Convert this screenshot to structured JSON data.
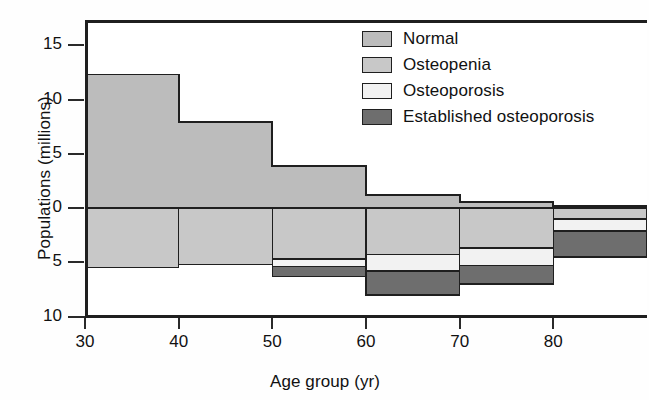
{
  "chart_data": {
    "type": "area",
    "title": "",
    "xlabel": "Age group (yr)",
    "ylabel": "Populations (millions)",
    "x_tick_labels": [
      "30",
      "40",
      "50",
      "60",
      "70",
      "80"
    ],
    "x_tick_values": [
      30,
      40,
      50,
      60,
      70,
      80
    ],
    "y_tick_labels": [
      "15",
      "10",
      "5",
      "0",
      "5",
      "10"
    ],
    "y_tick_values": [
      15,
      10,
      5,
      0,
      -5,
      -10
    ],
    "ylim": [
      -10,
      17.2
    ],
    "xlim": [
      30,
      90
    ],
    "grid": false,
    "legend_position": "top-right",
    "bins": [
      {
        "from": 30,
        "to": 40
      },
      {
        "from": 40,
        "to": 50
      },
      {
        "from": 50,
        "to": 60
      },
      {
        "from": 60,
        "to": 70
      },
      {
        "from": 70,
        "to": 80
      },
      {
        "from": 80,
        "to": 90
      }
    ],
    "series": [
      {
        "name": "Normal",
        "color": "#bcbcbc",
        "direction": "up",
        "values": [
          12.3,
          7.9,
          3.9,
          1.2,
          0.55,
          0.2
        ]
      },
      {
        "name": "Osteopenia",
        "color": "#c8c8c8",
        "direction": "down",
        "values": [
          5.5,
          5.2,
          4.7,
          4.3,
          3.7,
          1.0
        ]
      },
      {
        "name": "Osteoporosis",
        "color": "#f2f2f2",
        "direction": "down",
        "values": [
          0.0,
          0.0,
          0.7,
          1.5,
          1.6,
          1.1
        ]
      },
      {
        "name": "Established osteoporosis",
        "color": "#6e6e6e",
        "direction": "down",
        "values": [
          0.0,
          0.0,
          0.9,
          2.2,
          1.7,
          2.4
        ]
      }
    ]
  },
  "legend": {
    "items": [
      {
        "label": "Normal",
        "color": "#bcbcbc"
      },
      {
        "label": "Osteopenia",
        "color": "#c8c8c8"
      },
      {
        "label": "Osteoporosis",
        "color": "#f2f2f2"
      },
      {
        "label": "Established osteoporosis",
        "color": "#6e6e6e"
      }
    ]
  },
  "axes": {
    "x_title": "Age group (yr)",
    "y_title": "Populations (millions)"
  }
}
